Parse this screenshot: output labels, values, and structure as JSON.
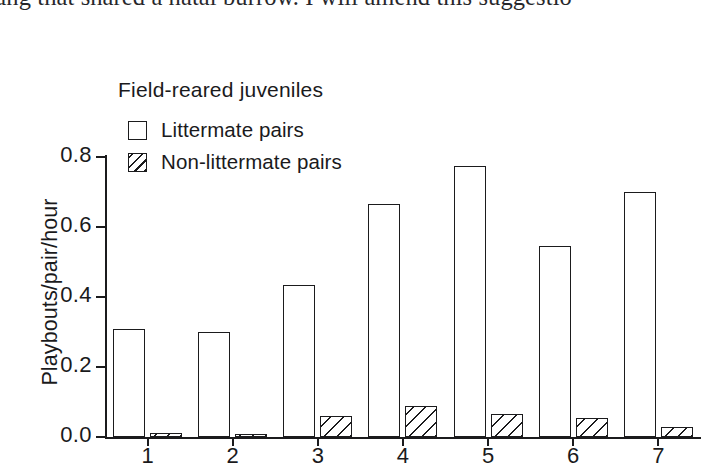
{
  "page": {
    "body_text_line": "ung that shared a natal burrow. I will amend this suggestio"
  },
  "figure": {
    "title": "Field-reared juveniles",
    "ylabel": "Playbouts/pair/hour",
    "legend": [
      {
        "label": "Littermate pairs",
        "marker": "open-square"
      },
      {
        "label": "Non-littermate pairs",
        "marker": "hatched-square"
      }
    ]
  },
  "chart_data": {
    "type": "bar",
    "title": "Field-reared juveniles",
    "xlabel": "",
    "ylabel": "Playbouts/pair/hour",
    "categories": [
      "1",
      "2",
      "3",
      "4",
      "5",
      "6",
      "7"
    ],
    "series": [
      {
        "name": "Littermate pairs",
        "values": [
          0.31,
          0.3,
          0.435,
          0.665,
          0.775,
          0.545,
          0.7
        ]
      },
      {
        "name": "Non-littermate pairs",
        "values": [
          0.012,
          0.01,
          0.06,
          0.09,
          0.065,
          0.055,
          0.03
        ]
      }
    ],
    "ylim": [
      0.0,
      0.85
    ],
    "yticks": [
      "0.0",
      "0.2",
      "0.4",
      "0.6",
      "0.8"
    ],
    "ytick_values": [
      0.0,
      0.2,
      0.4,
      0.6,
      0.8
    ],
    "grid": false,
    "legend_position": "upper-left-inside"
  }
}
